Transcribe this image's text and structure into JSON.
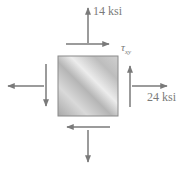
{
  "diagram": {
    "labels": {
      "sigma_y": "14 ksi",
      "sigma_x": "24 ksi",
      "tau_xy_symbol": "τ",
      "tau_xy_subscript": "xy"
    },
    "colors": {
      "arrow": "#7a7a7a",
      "square_light": "#e8e8e8",
      "square_dark": "#a9a9a9",
      "square_border": "#8a8a8a"
    }
  }
}
